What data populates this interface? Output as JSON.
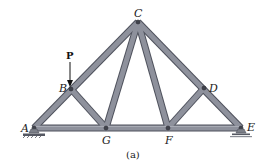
{
  "figure": {
    "caption": "(a)",
    "load": {
      "label": "P",
      "joint": "B",
      "direction": "down"
    },
    "joints": [
      {
        "id": "A",
        "label": "A",
        "x": 34,
        "y": 128,
        "support": "pin"
      },
      {
        "id": "B",
        "label": "B",
        "x": 71,
        "y": 89
      },
      {
        "id": "C",
        "label": "C",
        "x": 138,
        "y": 22
      },
      {
        "id": "D",
        "label": "D",
        "x": 204,
        "y": 88
      },
      {
        "id": "E",
        "label": "E",
        "x": 241,
        "y": 128,
        "support": "roller"
      },
      {
        "id": "F",
        "label": "F",
        "x": 168,
        "y": 128
      },
      {
        "id": "G",
        "label": "G",
        "x": 106,
        "y": 128
      }
    ],
    "members": [
      [
        "A",
        "B"
      ],
      [
        "B",
        "C"
      ],
      [
        "C",
        "D"
      ],
      [
        "D",
        "E"
      ],
      [
        "A",
        "G"
      ],
      [
        "G",
        "F"
      ],
      [
        "F",
        "E"
      ],
      [
        "B",
        "G"
      ],
      [
        "G",
        "C"
      ],
      [
        "C",
        "F"
      ],
      [
        "F",
        "D"
      ]
    ],
    "colors": {
      "member_fill": "#8a8d99",
      "member_edge": "#4e515c",
      "support": "#7c7f88"
    }
  }
}
